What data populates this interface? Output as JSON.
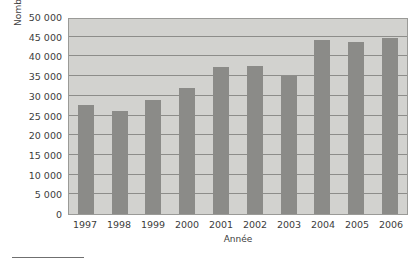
{
  "chart_data": {
    "type": "bar",
    "title": "",
    "xlabel": "Année",
    "ylabel": "Nombre d'immigrants",
    "categories": [
      "1997",
      "1998",
      "1999",
      "2000",
      "2001",
      "2002",
      "2003",
      "2004",
      "2005",
      "2006"
    ],
    "values": [
      27700,
      26100,
      28900,
      32000,
      37300,
      37600,
      35000,
      44200,
      43700,
      44700
    ],
    "ylim": [
      0,
      50000
    ],
    "ytick_values": [
      0,
      5000,
      10000,
      15000,
      20000,
      25000,
      30000,
      35000,
      40000,
      45000,
      50000
    ],
    "ytick_labels": [
      "0",
      "5 000",
      "10 000",
      "15 000",
      "20 000",
      "25 000",
      "30 000",
      "35 000",
      "40 000",
      "45 000",
      "50 000"
    ],
    "grid": true,
    "legend": null,
    "colors": {
      "bar": "#8b8b88",
      "plot_background": "#d2d2cf",
      "gridline": "#8d8d8a",
      "axis_border": "#9a9a97",
      "text": "#3d3d3d",
      "page_background": "#ffffff",
      "footnote_rule": "#6f6f6f"
    }
  }
}
